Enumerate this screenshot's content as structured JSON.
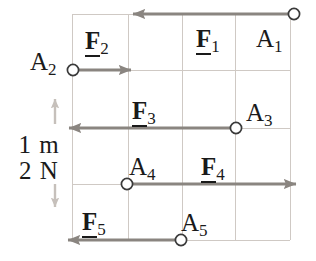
{
  "figure": {
    "background_color": "#ffffff",
    "grid": {
      "line_color": "#cfc9c4",
      "x_lines": [
        72,
        128,
        182,
        235,
        290
      ],
      "y_lines": [
        14,
        70,
        128,
        184,
        240
      ],
      "cell_width_px": 54,
      "cell_height_px": 56
    },
    "scale": {
      "length_label": "1 m",
      "force_label": "2 N",
      "arrow_color": "#bdb7b2",
      "top_y": 98,
      "bottom_y": 208
    },
    "vector_color": "#8a8580",
    "marker_color": "#3a3a3a",
    "vectors": [
      {
        "force_label": "F",
        "force_index": "1",
        "point_label": "A",
        "point_index": "1",
        "direction": "left",
        "origin_x": 293,
        "origin_y": 14,
        "tip_x": 133,
        "length_px": 160,
        "length_cells": 3,
        "magnitude_N": 6
      },
      {
        "force_label": "F",
        "force_index": "2",
        "point_label": "A",
        "point_index": "2",
        "direction": "right",
        "origin_x": 74,
        "origin_y": 70,
        "tip_x": 131,
        "length_px": 57,
        "length_cells": 1,
        "magnitude_N": 2
      },
      {
        "force_label": "F",
        "force_index": "3",
        "point_label": "A",
        "point_index": "3",
        "direction": "left",
        "origin_x": 235,
        "origin_y": 128,
        "tip_x": 69,
        "length_px": 166,
        "length_cells": 3,
        "magnitude_N": 6
      },
      {
        "force_label": "F",
        "force_index": "4",
        "point_label": "A",
        "point_index": "4",
        "direction": "right",
        "origin_x": 128,
        "origin_y": 184,
        "tip_x": 296,
        "length_px": 168,
        "length_cells": 3,
        "magnitude_N": 6
      },
      {
        "force_label": "F",
        "force_index": "5",
        "point_label": "A",
        "point_index": "5",
        "direction": "left",
        "origin_x": 180,
        "origin_y": 240,
        "tip_x": 68,
        "length_px": 112,
        "length_cells": 2,
        "magnitude_N": 4
      }
    ],
    "labels": {
      "f1": {
        "x": 196,
        "y": 26
      },
      "a1": {
        "x": 256,
        "y": 26
      },
      "f2": {
        "x": 85,
        "y": 28
      },
      "a2": {
        "x": 33,
        "y": 48
      },
      "f3": {
        "x": 132,
        "y": 98
      },
      "a3": {
        "x": 245,
        "y": 98
      },
      "f4": {
        "x": 200,
        "y": 152
      },
      "a4": {
        "x": 130,
        "y": 152
      },
      "f5": {
        "x": 82,
        "y": 208
      },
      "a5": {
        "x": 180,
        "y": 208
      }
    }
  }
}
